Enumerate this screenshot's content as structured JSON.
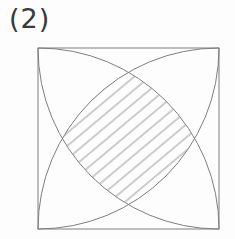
{
  "figure": {
    "label": "(2)",
    "label_color": "#3a3a3a",
    "background_color": "#fdfdfd",
    "line_color": "#7e7e7e",
    "line_width": 1,
    "square": {
      "x": 38,
      "y": 48,
      "side": 181
    },
    "arc_radius": 181,
    "arcs": [
      {
        "center": "top-left"
      },
      {
        "center": "top-right"
      },
      {
        "center": "bottom-left"
      },
      {
        "center": "bottom-right"
      }
    ],
    "hatch": {
      "angle_deg": 40,
      "spacing_px": 10,
      "color": "#9b9b9b",
      "stroke_width": 1
    }
  }
}
